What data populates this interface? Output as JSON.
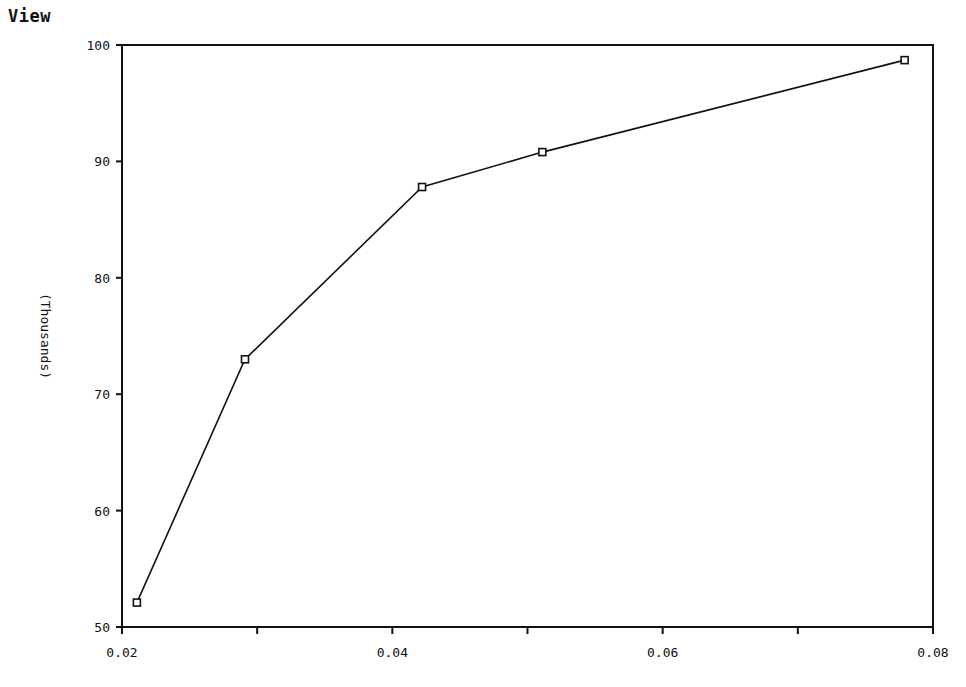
{
  "window": {
    "title": "View"
  },
  "chart_data": {
    "type": "line",
    "title": "",
    "xlabel": "",
    "ylabel": "(Thousands)",
    "xlim": [
      0.02,
      0.08
    ],
    "ylim": [
      50,
      100
    ],
    "x_ticks": [
      "0.02",
      "0.04",
      "0.06",
      "0.08"
    ],
    "x_minor_ticks": [
      0.03,
      0.05,
      0.07
    ],
    "y_ticks": [
      "50",
      "60",
      "70",
      "80",
      "90",
      "100"
    ],
    "grid": false,
    "legend": null,
    "series": [
      {
        "name": "series1",
        "marker": "square",
        "x": [
          0.0211,
          0.0291,
          0.0422,
          0.0511,
          0.0779
        ],
        "y": [
          52.1,
          73.0,
          87.8,
          90.8,
          98.7
        ]
      }
    ]
  }
}
